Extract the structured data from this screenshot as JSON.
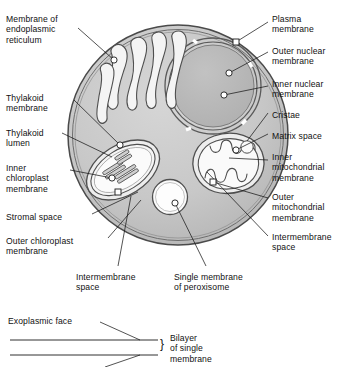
{
  "diagram": {
    "title_visible": false,
    "type": "cell-organelle-membrane-diagram",
    "colors": {
      "cytoplasm": "#c9c9c9",
      "nucleus": "#b9b9b9",
      "organelle_lumen": "#f2f2f2",
      "outline": "#3a3a3a",
      "text": "#111111",
      "background": "#ffffff"
    },
    "labels_left": [
      {
        "id": "membrane-of-er",
        "text": "Membrane of\nendoplasmic\nreticulum",
        "x": 6,
        "y": 14
      },
      {
        "id": "thylakoid-membrane",
        "text": "Thylakoid\nmembrane",
        "x": 6,
        "y": 93
      },
      {
        "id": "thylakoid-lumen",
        "text": "Thylakoid\nlumen",
        "x": 6,
        "y": 128
      },
      {
        "id": "inner-chloroplast-membrane",
        "text": "Inner\nchloroplast\nmembrane",
        "x": 6,
        "y": 163
      },
      {
        "id": "stromal-space",
        "text": "Stromal space",
        "x": 6,
        "y": 212
      },
      {
        "id": "outer-chloroplast-membrane",
        "text": "Outer chloroplast\nmembrane",
        "x": 6,
        "y": 236
      }
    ],
    "labels_right": [
      {
        "id": "plasma-membrane",
        "text": "Plasma\nmembrane",
        "x": 272,
        "y": 14
      },
      {
        "id": "outer-nuclear-membrane",
        "text": "Outer nuclear\nmembrane",
        "x": 272,
        "y": 46
      },
      {
        "id": "inner-nuclear-membrane",
        "text": "Inner nuclear\nmembrane",
        "x": 272,
        "y": 79
      },
      {
        "id": "cristae",
        "text": "Cristae",
        "x": 272,
        "y": 110
      },
      {
        "id": "matrix-space",
        "text": "Matrix space",
        "x": 272,
        "y": 131
      },
      {
        "id": "inner-mitochondrial-membrane",
        "text": "Inner\nmitochondrial\nmembrane",
        "x": 272,
        "y": 152
      },
      {
        "id": "outer-mitochondrial-membrane",
        "text": "Outer\nmitochondrial\nmembrane",
        "x": 272,
        "y": 192
      },
      {
        "id": "intermembrane-space-right",
        "text": "Intermembrane\nspace",
        "x": 272,
        "y": 232
      }
    ],
    "labels_bottom": [
      {
        "id": "intermembrane-space-bottom",
        "text": "Intermembrane\nspace",
        "x": 76,
        "y": 272
      },
      {
        "id": "single-membrane-of-peroxisome",
        "text": "Single membrane\nof peroxisome",
        "x": 174,
        "y": 272
      }
    ],
    "inset": {
      "exoplasmic_face": "Exoplasmic face",
      "bilayer_label": "Bilayer\nof single\nmembrane",
      "brace": "}"
    }
  }
}
